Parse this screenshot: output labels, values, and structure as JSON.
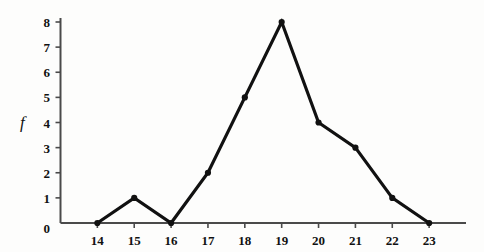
{
  "chart_data": {
    "type": "line",
    "title": "",
    "subtitle": "",
    "xlabel": "",
    "ylabel": "f",
    "categories": [
      14,
      15,
      16,
      17,
      18,
      19,
      20,
      21,
      22,
      23
    ],
    "values": [
      0,
      1,
      0,
      2,
      5,
      8,
      4,
      3,
      1,
      0
    ],
    "series": [
      {
        "name": "frequency",
        "values": [
          0,
          1,
          0,
          2,
          5,
          8,
          4,
          3,
          1,
          0
        ]
      }
    ],
    "x_tick_labels": [
      "14",
      "15",
      "16",
      "17",
      "18",
      "19",
      "20",
      "21",
      "22",
      "23"
    ],
    "y_tick_labels": [
      "0",
      "1",
      "2",
      "3",
      "4",
      "5",
      "6",
      "7",
      "8"
    ],
    "y_ticks": [
      0,
      1,
      2,
      3,
      4,
      5,
      6,
      7,
      8
    ],
    "xlim": [
      13.0,
      24.0
    ],
    "ylim": [
      0,
      8
    ],
    "grid": false,
    "legend": false,
    "legend_position": "none",
    "marker": "filled-dot",
    "line_color": "#111111",
    "marker_color": "#111111",
    "axis_color": "#4a4a4a",
    "background_color": "#fdfdfc",
    "annotations": []
  },
  "axes": {
    "y_axis_label": "f",
    "origin_label": "0"
  }
}
